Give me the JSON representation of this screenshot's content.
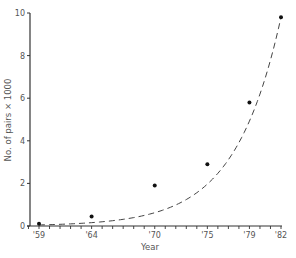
{
  "chart_data": {
    "type": "scatter",
    "title": "",
    "xlabel": "Year",
    "ylabel": "No. of pairs × 1000",
    "x_tick_labels": [
      "'59",
      "'64",
      "'70",
      "'75",
      "'79",
      "'82"
    ],
    "x_ticks": [
      1959,
      1964,
      1970,
      1975,
      1979,
      1982
    ],
    "y_ticks": [
      0,
      2,
      4,
      6,
      8,
      10
    ],
    "xlim": [
      1957,
      1982
    ],
    "ylim": [
      0,
      10
    ],
    "grid": false,
    "legend": null,
    "series": [
      {
        "name": "observed",
        "style": "points",
        "x": [
          1959,
          1964,
          1970,
          1975,
          1979,
          1982
        ],
        "y": [
          0.1,
          0.45,
          1.9,
          2.9,
          5.8,
          9.8
        ]
      },
      {
        "name": "fitted exponential curve",
        "style": "dashed-line",
        "x": [
          1959,
          1964,
          1970,
          1975,
          1979,
          1982
        ],
        "y": [
          0.05,
          0.45,
          1.5,
          3.2,
          5.9,
          9.8
        ]
      }
    ]
  },
  "labels": {
    "xlabel": "Year",
    "ylabel": "No. of pairs × 1000"
  }
}
